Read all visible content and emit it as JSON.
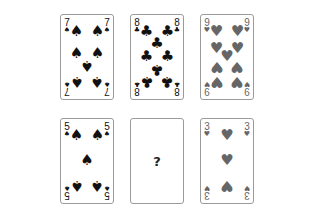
{
  "table": {
    "rows": [
      {
        "cards": [
          {
            "rank": "7",
            "suit": "spades",
            "glyph": "♠",
            "color": "#111111",
            "face_up": true
          },
          {
            "rank": "8",
            "suit": "clubs",
            "glyph": "♣",
            "color": "#111111",
            "face_up": true
          },
          {
            "rank": "9",
            "suit": "hearts",
            "glyph": "♥",
            "color": "#666666",
            "face_up": true
          }
        ]
      },
      {
        "cards": [
          {
            "rank": "5",
            "suit": "spades",
            "glyph": "♠",
            "color": "#111111",
            "face_up": true
          },
          {
            "rank": "?",
            "suit": "unknown",
            "glyph": "?",
            "color": "#222222",
            "face_up": false
          },
          {
            "rank": "3",
            "suit": "hearts",
            "glyph": "♥",
            "color": "#666666",
            "face_up": true
          }
        ]
      }
    ]
  }
}
